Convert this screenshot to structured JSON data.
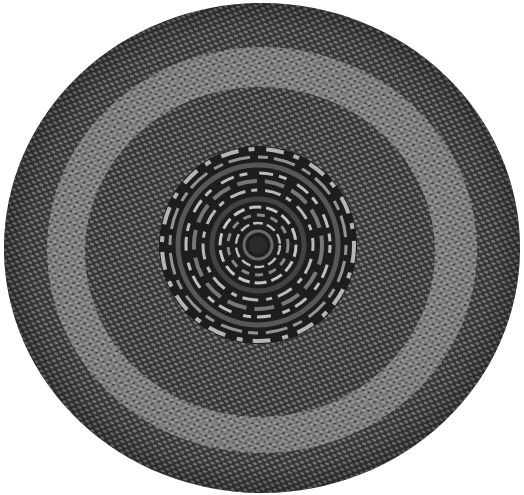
{
  "image": {
    "subject": "braided round rug",
    "description": "Grayscale photograph of a round braided rug with a concentric coiled center medallion, a dark inner field, a lighter middle band, and a dark outer border",
    "colors": {
      "background": "#ffffff",
      "outer_border": "#3a3a3a",
      "light_band": "#8a8a8a",
      "inner_field": "#383838",
      "medallion_dark": "#1e1e1e",
      "medallion_light": "#bdbdbd",
      "braid_highlight": "#c8c8c8"
    }
  }
}
